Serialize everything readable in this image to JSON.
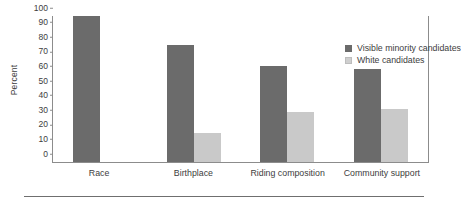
{
  "chart_data": {
    "type": "bar",
    "title": "",
    "xlabel": "",
    "ylabel": "Percent",
    "ylim": [
      0,
      100
    ],
    "yticks": [
      0,
      10,
      20,
      30,
      40,
      50,
      60,
      70,
      80,
      90,
      100
    ],
    "ytick_labels": [
      "0",
      "10",
      "20",
      "30",
      "40",
      "50",
      "60",
      "70",
      "80",
      "90",
      "100"
    ],
    "grid": false,
    "legend_position": "top-right",
    "categories": [
      "Race",
      "Birthplace",
      "Riding composition",
      "Community support"
    ],
    "series": [
      {
        "name": "Visible minority candidates",
        "color": "#6b6b6b",
        "values": [
          100,
          80,
          66,
          64
        ]
      },
      {
        "name": "White candidates",
        "color": "#c9c9c9",
        "values": [
          null,
          20,
          34,
          36
        ]
      }
    ]
  },
  "colors": {
    "dark_series": "#6b6b6b",
    "light_series": "#c9c9c9",
    "axis": "#8c8c8c",
    "text": "#3d3d3d",
    "background": "#ffffff",
    "rule": "#6f6f6f"
  }
}
